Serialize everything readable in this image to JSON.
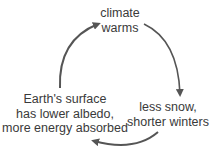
{
  "diagram": {
    "type": "feedback-cycle",
    "nodes": [
      {
        "id": "top",
        "lines": [
          "climate",
          "warms"
        ]
      },
      {
        "id": "right",
        "lines": [
          "less snow,",
          "shorter winters"
        ]
      },
      {
        "id": "left",
        "lines": [
          "Earth's surface",
          "has lower albedo,",
          "more energy absorbed"
        ]
      }
    ],
    "edges": [
      {
        "from": "top",
        "to": "right"
      },
      {
        "from": "right",
        "to": "left"
      },
      {
        "from": "left",
        "to": "top"
      }
    ],
    "colors": {
      "text": "#3a3a3a",
      "arrow": "#555555",
      "background": "#ffffff"
    }
  }
}
